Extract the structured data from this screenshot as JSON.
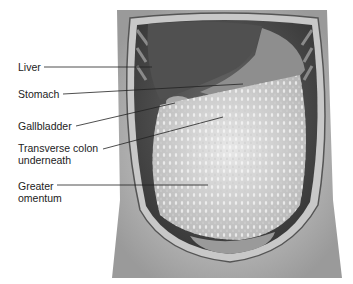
{
  "diagram": {
    "type": "anatomical illustration",
    "labels": [
      {
        "id": "liver",
        "lines": [
          "Liver"
        ]
      },
      {
        "id": "stomach",
        "lines": [
          "Stomach"
        ]
      },
      {
        "id": "gallbladder",
        "lines": [
          "Gallbladder"
        ]
      },
      {
        "id": "transverse-colon",
        "lines": [
          "Transverse colon",
          "underneath"
        ]
      },
      {
        "id": "greater-omentum",
        "lines": [
          "Greater",
          "omentum"
        ]
      }
    ]
  }
}
